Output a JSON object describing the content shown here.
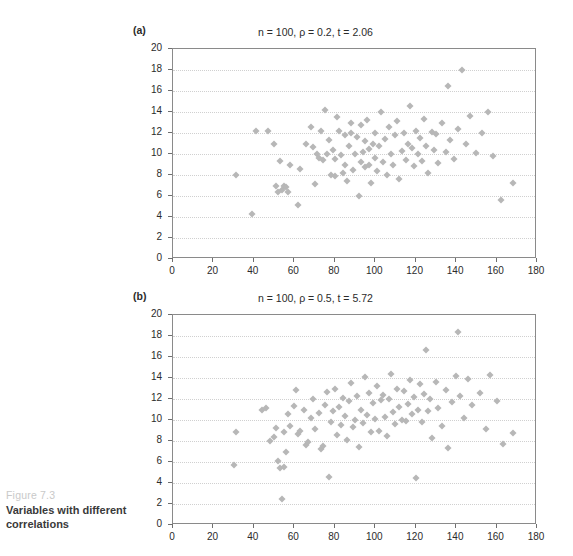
{
  "figure": {
    "number": "Figure 7.3",
    "title": "Variables with different correlations"
  },
  "chart_data": [
    {
      "type": "scatter",
      "panel": "(a)",
      "title": "n = 100, ρ = 0.2, t = 2.06",
      "n": 100,
      "rho": 0.2,
      "t": 2.06,
      "xlabel": "",
      "ylabel": "",
      "xlim": [
        0,
        180
      ],
      "ylim": [
        0,
        20
      ],
      "xticks": [
        0,
        20,
        40,
        60,
        80,
        100,
        120,
        140,
        160,
        180
      ],
      "yticks": [
        0,
        2,
        4,
        6,
        8,
        10,
        12,
        14,
        16,
        18,
        20
      ],
      "grid": "horizontal-dotted",
      "legend": "none",
      "marker": "diamond",
      "marker_color": "#b7b7b7",
      "points": [
        [
          31,
          8.0
        ],
        [
          39,
          4.3
        ],
        [
          41,
          12.2
        ],
        [
          47,
          12.2
        ],
        [
          50,
          11.0
        ],
        [
          51,
          7.0
        ],
        [
          52,
          6.4
        ],
        [
          53,
          9.3
        ],
        [
          54,
          6.6
        ],
        [
          55,
          7.0
        ],
        [
          56,
          6.9
        ],
        [
          57,
          6.4
        ],
        [
          58,
          9.0
        ],
        [
          62,
          5.1
        ],
        [
          63,
          8.6
        ],
        [
          66,
          11.0
        ],
        [
          68,
          12.6
        ],
        [
          69,
          10.7
        ],
        [
          70,
          7.1
        ],
        [
          71,
          10.0
        ],
        [
          72,
          9.6
        ],
        [
          73,
          12.2
        ],
        [
          74,
          9.4
        ],
        [
          75,
          14.2
        ],
        [
          76,
          10.0
        ],
        [
          77,
          11.3
        ],
        [
          78,
          8.0
        ],
        [
          79,
          10.4
        ],
        [
          80,
          7.9
        ],
        [
          80,
          9.5
        ],
        [
          81,
          13.5
        ],
        [
          82,
          12.2
        ],
        [
          83,
          9.9
        ],
        [
          84,
          8.2
        ],
        [
          85,
          11.8
        ],
        [
          85,
          9.0
        ],
        [
          86,
          7.4
        ],
        [
          87,
          10.8
        ],
        [
          88,
          13.0
        ],
        [
          88,
          12.0
        ],
        [
          89,
          8.5
        ],
        [
          90,
          10.0
        ],
        [
          91,
          11.6
        ],
        [
          92,
          6.0
        ],
        [
          93,
          9.2
        ],
        [
          93,
          12.8
        ],
        [
          94,
          10.2
        ],
        [
          95,
          8.8
        ],
        [
          95,
          11.2
        ],
        [
          96,
          13.2
        ],
        [
          97,
          9.0
        ],
        [
          97,
          10.5
        ],
        [
          98,
          7.2
        ],
        [
          99,
          11.0
        ],
        [
          100,
          9.6
        ],
        [
          100,
          12.0
        ],
        [
          101,
          8.4
        ],
        [
          102,
          10.8
        ],
        [
          103,
          14.0
        ],
        [
          104,
          9.2
        ],
        [
          105,
          11.4
        ],
        [
          106,
          8.0
        ],
        [
          107,
          12.6
        ],
        [
          108,
          10.0
        ],
        [
          109,
          9.0
        ],
        [
          110,
          11.8
        ],
        [
          111,
          13.1
        ],
        [
          112,
          7.6
        ],
        [
          113,
          10.3
        ],
        [
          114,
          12.0
        ],
        [
          115,
          9.4
        ],
        [
          116,
          11.0
        ],
        [
          117,
          14.6
        ],
        [
          118,
          10.6
        ],
        [
          119,
          8.9
        ],
        [
          120,
          12.2
        ],
        [
          121,
          10.0
        ],
        [
          122,
          11.5
        ],
        [
          123,
          9.3
        ],
        [
          124,
          13.3
        ],
        [
          125,
          10.8
        ],
        [
          126,
          8.2
        ],
        [
          128,
          12.1
        ],
        [
          129,
          10.4
        ],
        [
          130,
          11.9
        ],
        [
          131,
          9.1
        ],
        [
          133,
          13.0
        ],
        [
          135,
          10.2
        ],
        [
          136,
          16.5
        ],
        [
          137,
          11.3
        ],
        [
          139,
          9.5
        ],
        [
          141,
          12.4
        ],
        [
          143,
          18.0
        ],
        [
          145,
          11.0
        ],
        [
          147,
          13.6
        ],
        [
          150,
          10.1
        ],
        [
          153,
          12.0
        ],
        [
          156,
          14.0
        ],
        [
          158,
          9.8
        ],
        [
          162,
          5.6
        ],
        [
          168,
          7.2
        ]
      ]
    },
    {
      "type": "scatter",
      "panel": "(b)",
      "title": "n = 100, ρ = 0.5, t = 5.72",
      "n": 100,
      "rho": 0.5,
      "t": 5.72,
      "xlabel": "",
      "ylabel": "",
      "xlim": [
        0,
        180
      ],
      "ylim": [
        0,
        20
      ],
      "xticks": [
        0,
        20,
        40,
        60,
        80,
        100,
        120,
        140,
        160,
        180
      ],
      "yticks": [
        0,
        2,
        4,
        6,
        8,
        10,
        12,
        14,
        16,
        18,
        20
      ],
      "grid": "horizontal-dotted",
      "legend": "none",
      "marker": "diamond",
      "marker_color": "#b7b7b7",
      "points": [
        [
          30,
          5.7
        ],
        [
          31,
          8.9
        ],
        [
          44,
          11.0
        ],
        [
          46,
          11.1
        ],
        [
          48,
          8.0
        ],
        [
          50,
          8.4
        ],
        [
          51,
          9.2
        ],
        [
          52,
          6.1
        ],
        [
          53,
          5.4
        ],
        [
          54,
          2.5
        ],
        [
          55,
          5.5
        ],
        [
          55,
          8.9
        ],
        [
          56,
          7.0
        ],
        [
          57,
          10.6
        ],
        [
          58,
          9.4
        ],
        [
          60,
          11.3
        ],
        [
          61,
          12.9
        ],
        [
          62,
          8.7
        ],
        [
          63,
          9.0
        ],
        [
          65,
          11.0
        ],
        [
          66,
          7.6
        ],
        [
          67,
          7.9
        ],
        [
          68,
          10.2
        ],
        [
          69,
          12.0
        ],
        [
          70,
          9.1
        ],
        [
          72,
          10.7
        ],
        [
          73,
          7.2
        ],
        [
          74,
          7.5
        ],
        [
          75,
          11.4
        ],
        [
          76,
          12.7
        ],
        [
          77,
          4.6
        ],
        [
          78,
          9.8
        ],
        [
          79,
          10.9
        ],
        [
          80,
          13.0
        ],
        [
          81,
          8.6
        ],
        [
          82,
          11.2
        ],
        [
          83,
          9.5
        ],
        [
          84,
          12.1
        ],
        [
          85,
          10.4
        ],
        [
          86,
          8.1
        ],
        [
          87,
          11.8
        ],
        [
          88,
          13.5
        ],
        [
          89,
          9.3
        ],
        [
          90,
          10.0
        ],
        [
          91,
          12.3
        ],
        [
          92,
          7.4
        ],
        [
          93,
          11.0
        ],
        [
          94,
          9.7
        ],
        [
          95,
          14.1
        ],
        [
          96,
          10.5
        ],
        [
          97,
          12.6
        ],
        [
          98,
          8.9
        ],
        [
          99,
          11.6
        ],
        [
          100,
          10.1
        ],
        [
          101,
          13.2
        ],
        [
          102,
          9.0
        ],
        [
          103,
          11.9
        ],
        [
          104,
          12.4
        ],
        [
          105,
          10.3
        ],
        [
          106,
          8.5
        ],
        [
          107,
          12.0
        ],
        [
          108,
          14.4
        ],
        [
          109,
          10.8
        ],
        [
          110,
          9.6
        ],
        [
          111,
          13.0
        ],
        [
          112,
          11.2
        ],
        [
          113,
          10.0
        ],
        [
          114,
          12.8
        ],
        [
          115,
          9.9
        ],
        [
          116,
          11.5
        ],
        [
          117,
          13.8
        ],
        [
          118,
          10.6
        ],
        [
          119,
          12.2
        ],
        [
          120,
          4.5
        ],
        [
          121,
          11.0
        ],
        [
          122,
          13.4
        ],
        [
          123,
          9.8
        ],
        [
          124,
          12.5
        ],
        [
          125,
          16.7
        ],
        [
          126,
          10.9
        ],
        [
          127,
          12.0
        ],
        [
          128,
          8.3
        ],
        [
          130,
          13.6
        ],
        [
          131,
          11.1
        ],
        [
          133,
          9.4
        ],
        [
          135,
          12.9
        ],
        [
          136,
          7.3
        ],
        [
          138,
          11.7
        ],
        [
          140,
          14.2
        ],
        [
          141,
          18.4
        ],
        [
          142,
          12.3
        ],
        [
          144,
          10.2
        ],
        [
          146,
          13.9
        ],
        [
          148,
          11.4
        ],
        [
          152,
          12.6
        ],
        [
          155,
          9.1
        ],
        [
          157,
          14.3
        ],
        [
          160,
          11.8
        ],
        [
          163,
          7.7
        ],
        [
          168,
          8.8
        ]
      ]
    }
  ]
}
